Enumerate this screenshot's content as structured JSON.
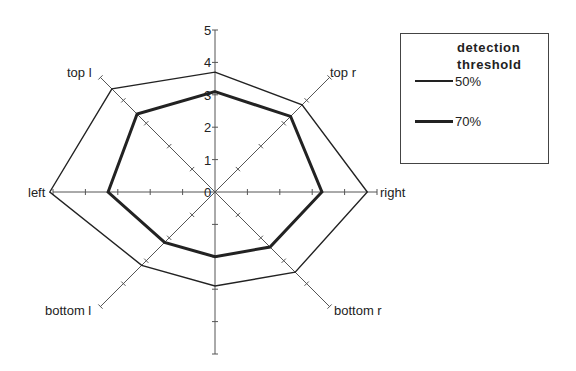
{
  "chart_data": {
    "type": "radar",
    "title": "",
    "categories": [
      "top",
      "top r",
      "right",
      "bottom r",
      "bottom",
      "bottom l",
      "left",
      "top l"
    ],
    "axis": {
      "min": 0,
      "max": 5,
      "ticks": [
        0,
        1,
        2,
        3,
        4,
        5
      ]
    },
    "legend": {
      "title": "detection threshold",
      "position": "right"
    },
    "series": [
      {
        "name": "50%",
        "line": "thin",
        "values": [
          3.7,
          3.8,
          4.7,
          3.5,
          2.9,
          3.2,
          5.1,
          4.5
        ]
      },
      {
        "name": "70%",
        "line": "thick",
        "values": [
          3.1,
          3.3,
          3.3,
          2.4,
          2.0,
          2.2,
          3.3,
          3.4
        ]
      }
    ],
    "colors": {
      "line": "#222222",
      "axis": "#555555"
    }
  },
  "legend": {
    "title_line1": "detection",
    "title_line2": "threshold",
    "items": [
      {
        "label": "50%"
      },
      {
        "label": "70%"
      }
    ]
  },
  "axis_labels": {
    "top_l": "top l",
    "top_r": "top r",
    "right": "right",
    "bottom_r": "bottom r",
    "bottom_l": "bottom l",
    "left": "left"
  },
  "tick_labels": [
    "0",
    "1",
    "2",
    "3",
    "4",
    "5"
  ]
}
